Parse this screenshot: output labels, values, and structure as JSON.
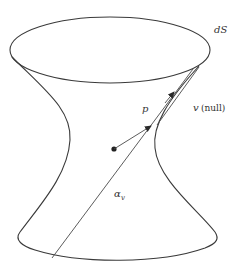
{
  "figure": {
    "kind": "de Sitter hyperboloid diagram",
    "labels": {
      "space": "dS",
      "momentum": "p",
      "null_vector": "v",
      "null_note": "(null)",
      "geodesic": "α",
      "geodesic_subscript": "v"
    },
    "colors": {
      "stroke": "#3a3a3a",
      "point": "#222222",
      "background": "#ffffff"
    }
  }
}
